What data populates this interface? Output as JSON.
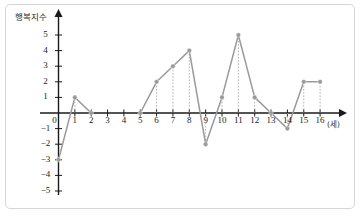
{
  "figure": {
    "frame_color": "#d6d6d6",
    "background": "#ffffff"
  },
  "chart_data": {
    "type": "line",
    "title": "",
    "xlabel": "(세)",
    "ylabel": "행복지수",
    "x": [
      0,
      1,
      2,
      5,
      6,
      7,
      8,
      9,
      10,
      11,
      12,
      13,
      14,
      15,
      16
    ],
    "values": [
      -3,
      1,
      0,
      0,
      2,
      3,
      4,
      -2,
      1,
      5,
      1,
      0,
      -1,
      2,
      2
    ],
    "gap_after_x": 2,
    "gap_resume_x": 5,
    "missing_x": [
      3,
      4
    ],
    "xlim": [
      0,
      16
    ],
    "ylim": [
      -5,
      5
    ],
    "xticks": [
      0,
      1,
      2,
      3,
      4,
      5,
      6,
      7,
      8,
      9,
      10,
      11,
      12,
      13,
      14,
      15,
      16
    ],
    "xtick_labels": [
      "0",
      "1",
      "2",
      "3",
      "4",
      "5",
      "6",
      "7",
      "8",
      "9",
      "10",
      "11",
      "12",
      "13",
      "14",
      "15",
      "16"
    ],
    "yticks": [
      5,
      4,
      3,
      2,
      1,
      0,
      -1,
      -2,
      -3,
      -4,
      -5
    ],
    "ytick_labels": [
      "5",
      "4",
      "3",
      "2",
      "1",
      "0",
      "−1",
      "−2",
      "−3",
      "−4",
      "−5"
    ],
    "grid": false,
    "guide_lines": "dotted-vertical",
    "line_color": "#9a9a9a",
    "marker_color": "#9a9a9a",
    "marker_shape": "circle",
    "axis_color": "#1a1a1a",
    "legend": null
  }
}
